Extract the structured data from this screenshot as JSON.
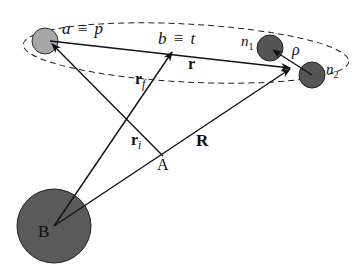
{
  "diagram": {
    "type": "scattering-coordinates",
    "nodes": {
      "a": {
        "label_a": "a",
        "equiv": "≡",
        "label_p": "p"
      },
      "b": {
        "label_b": "b",
        "equiv": "≡",
        "label_t": "t"
      },
      "n1": {
        "label": "n",
        "sub": "1"
      },
      "n2": {
        "label": "n",
        "sub": "2"
      },
      "A": {
        "label": "A"
      },
      "B": {
        "label": "B"
      }
    },
    "vectors": {
      "r": {
        "label": "r"
      },
      "R": {
        "label": "R"
      },
      "r_i": {
        "label": "r",
        "sub": "i"
      },
      "r_f": {
        "label": "r",
        "sub": "f"
      },
      "rho": {
        "label": "ρ"
      }
    },
    "colors": {
      "particle_light": "#a6a6a6",
      "particle_dark": "#555555",
      "target_B": "#5a5a5a",
      "line": "#111111"
    }
  }
}
